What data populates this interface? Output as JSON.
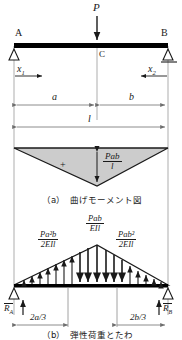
{
  "figure": {
    "kind": "structural-beam-diagram",
    "colors": {
      "ink": "#1a1a1a",
      "dimension_line": "#6e6e6e",
      "moment_fill": "#cccccc",
      "beam": "#000000"
    }
  },
  "beam": {
    "support_left_label": "A",
    "support_right_label": "B",
    "midpoint_label": "C",
    "load_label": "P",
    "coord_left_label": "x",
    "coord_left_sub": "1",
    "coord_right_label": "x",
    "coord_right_sub": "2"
  },
  "dimensions_top": [
    {
      "name": "segment-a",
      "label": "a"
    },
    {
      "name": "segment-b",
      "label": "b"
    },
    {
      "name": "span-l",
      "label": "l"
    }
  ],
  "moment_diagram": {
    "sign_label": "+",
    "peak_numerator": "Pab",
    "peak_denominator": "l",
    "caption_index": "（a）",
    "caption_text": "曲げモーメント図"
  },
  "elastic_load_diagram": {
    "left_numerator": "Pa²b",
    "left_denominator": "2EIl",
    "center_numerator": "Pab",
    "center_denominator": "EIl",
    "right_numerator": "Pab²",
    "right_denominator": "2EIl",
    "reaction_left": "R",
    "reaction_left_sub": "A",
    "reaction_right": "R",
    "reaction_right_sub": "B",
    "dim_left_label": "2a/3",
    "dim_right_label": "2b/3",
    "caption_index": "（b）",
    "caption_text": "弾性荷重とたわ"
  }
}
